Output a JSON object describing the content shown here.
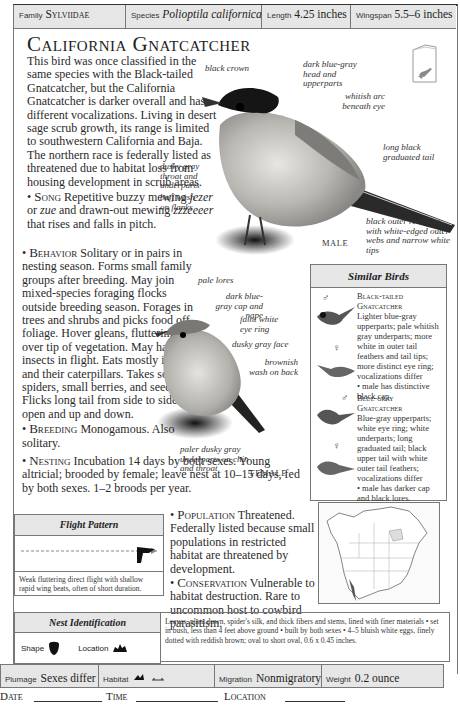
{
  "infobar": {
    "family_label": "Family",
    "family_value": "Sylviidae",
    "species_label": "Species",
    "species_value": "Polioptila californica",
    "length_label": "Length",
    "length_value": "4.25 inches",
    "wingspan_label": "Wingspan",
    "wingspan_value": "5.5–6 inches"
  },
  "title": "California Gnatcatcher",
  "intro": "This bird was once classified in the same species with the Black-tailed Gnatcatcher, but the California Gnatcatcher is darker overall and has different vocalizations. Living in desert sage scrub growth, its range is limited to southwestern California and Baja. The northern race is federally listed as threatened due to habitat loss from housing development in scrub areas.",
  "sections": {
    "song": {
      "head": "Song",
      "text_pre": " Repetitive buzzy mewing ",
      "call1": "jezer",
      "mid": " or ",
      "call2": "zue",
      "mid2": " and drawn-out mewing ",
      "call3": "zzzeeeer",
      "text_post": " that rises and falls in pitch."
    },
    "behavior": {
      "head": "Behavior",
      "text": " Solitary or in pairs in nesting season. Forms small family groups after breeding. May join mixed-species foraging flocks outside breeding season. Forages in trees and shrubs and picks food off foliage. Hover gleans, fluttering over tip of vegetation. May hawk insects in flight. Eats mostly insects and their caterpillars. Takes some spiders, small berries, and seeds. Flicks long tail from side to side or open and up and down."
    },
    "breeding": {
      "head": "Breeding",
      "text": " Monogamous. Also solitary."
    },
    "nesting": {
      "head": "Nesting",
      "text": " Incubation 14 days by both sexes. Young altricial; brooded by female; leave nest at 10–15 days, fed by both sexes. 1–2 broods per year."
    },
    "population": {
      "head": "Population",
      "text": " Threatened. Federally listed because small populations in restricted habitat are threatened by development."
    },
    "conservation": {
      "head": "Conservation",
      "text": " Vulnerable to habitat destruction. Rare to uncommon host to cowbird parasitism."
    }
  },
  "male_annotations": {
    "black_crown": "black crown",
    "head": "dark blue-gray head and upperparts",
    "arc": "whitish arc beneath eye",
    "throat": "dusky gray throat and underparts",
    "flanks": "buff wash on flanks",
    "tail": "long black graduated tail",
    "rectrices": "black outer rectrices with white-edged outer webs and narrow white tips",
    "label": "MALE"
  },
  "female_annotations": {
    "lores": "pale lores",
    "cap": "dark blue-gray cap and nape",
    "eye_ring": "faint white eye ring",
    "face": "dusky gray face",
    "back": "brownish wash on back",
    "chin": "paler dusky gray underparts on chin and throat",
    "label": "FEMALE"
  },
  "similar_birds": {
    "title": "Similar Birds",
    "birds": [
      {
        "name_line1": "Black-tailed",
        "name_line2": "Gnatcatcher",
        "desc": "Lighter blue-gray upperparts; pale whitish gray underparts; more white in outer tail feathers and tail tips; more distinct eye ring; vocalizations differ",
        "note": "male has distinctive black cap."
      },
      {
        "name_line1": "Blue-gray",
        "name_line2": "Gnatcatcher",
        "desc": "Blue-gray upperparts; white eye ring; white underparts; long graduated tail; black upper tail with white outer tail feathers; vocalizations differ",
        "note": "male has darker cap and black lores."
      }
    ],
    "male_symbol": "♂",
    "female_symbol": "♀"
  },
  "flight_pattern": {
    "title": "Flight Pattern",
    "description": "Weak fluttering direct flight with shallow rapid wing beats, often of short duration."
  },
  "nest_identification": {
    "title": "Nest Identification",
    "shape_label": "Shape",
    "location_label": "Location",
    "description": "Leaves, plant down, spider's silk, and thick fibers and stems, lined with finer materials • set in bush, less than 4 feet above ground • built by both sexes • 4–5 bluish white eggs, finely dotted with reddish brown; oval to short oval, 0.6 x 0.45 inches."
  },
  "bottombar": {
    "plumage_label": "Plumage",
    "plumage_value": "Sexes differ",
    "habitat_label": "Habitat",
    "migration_label": "Migration",
    "migration_value": "Nonmigratory",
    "weight_label": "Weight",
    "weight_value": "0.2 ounce"
  },
  "field_notes": {
    "date_label": "Date",
    "time_label": "Time",
    "location_label": "Location"
  },
  "colors": {
    "bar_gray": "#e6e6e6",
    "border": "#777777",
    "text": "#222222",
    "range_color": "#555555"
  }
}
